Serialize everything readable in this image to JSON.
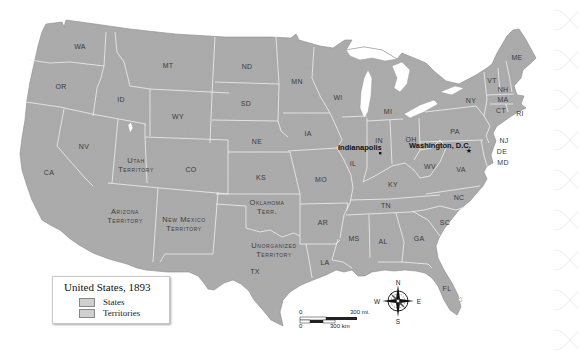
{
  "legend": {
    "title": "United States, 1893",
    "items": [
      {
        "label": "States",
        "color": "#d0d0d0"
      },
      {
        "label": "Territories",
        "color": "#d6d6d6"
      }
    ]
  },
  "colors": {
    "land": "#a9a9a9",
    "border": "#f2f2f2",
    "water": "#ffffff",
    "label": "#3a3a3a"
  },
  "states": [
    {
      "abbr": "WA",
      "x": 80,
      "y": 46
    },
    {
      "abbr": "OR",
      "x": 61,
      "y": 86
    },
    {
      "abbr": "ID",
      "x": 121,
      "y": 99
    },
    {
      "abbr": "MT",
      "x": 168,
      "y": 65
    },
    {
      "abbr": "WY",
      "x": 178,
      "y": 116
    },
    {
      "abbr": "NV",
      "x": 84,
      "y": 146
    },
    {
      "abbr": "CA",
      "x": 49,
      "y": 172
    },
    {
      "abbr": "CO",
      "x": 191,
      "y": 169
    },
    {
      "abbr": "ND",
      "x": 247,
      "y": 66
    },
    {
      "abbr": "SD",
      "x": 246,
      "y": 103
    },
    {
      "abbr": "NE",
      "x": 257,
      "y": 141
    },
    {
      "abbr": "KS",
      "x": 261,
      "y": 177
    },
    {
      "abbr": "MN",
      "x": 297,
      "y": 81
    },
    {
      "abbr": "IA",
      "x": 308,
      "y": 133
    },
    {
      "abbr": "MO",
      "x": 321,
      "y": 179
    },
    {
      "abbr": "AR",
      "x": 323,
      "y": 222
    },
    {
      "abbr": "LA",
      "x": 325,
      "y": 262
    },
    {
      "abbr": "TX",
      "x": 255,
      "y": 271
    },
    {
      "abbr": "WI",
      "x": 338,
      "y": 97
    },
    {
      "abbr": "MI",
      "x": 388,
      "y": 111
    },
    {
      "abbr": "IL",
      "x": 353,
      "y": 163
    },
    {
      "abbr": "IN",
      "x": 379,
      "y": 140
    },
    {
      "abbr": "OH",
      "x": 411,
      "y": 139
    },
    {
      "abbr": "KY",
      "x": 393,
      "y": 184
    },
    {
      "abbr": "TN",
      "x": 386,
      "y": 205
    },
    {
      "abbr": "MS",
      "x": 354,
      "y": 238
    },
    {
      "abbr": "AL",
      "x": 383,
      "y": 241
    },
    {
      "abbr": "GA",
      "x": 419,
      "y": 238
    },
    {
      "abbr": "FL",
      "x": 447,
      "y": 288
    },
    {
      "abbr": "SC",
      "x": 445,
      "y": 222
    },
    {
      "abbr": "NC",
      "x": 459,
      "y": 197
    },
    {
      "abbr": "VA",
      "x": 461,
      "y": 169
    },
    {
      "abbr": "WV",
      "x": 430,
      "y": 166
    },
    {
      "abbr": "PA",
      "x": 455,
      "y": 131
    },
    {
      "abbr": "NY",
      "x": 471,
      "y": 100
    },
    {
      "abbr": "VT",
      "x": 492,
      "y": 80
    },
    {
      "abbr": "NH",
      "x": 503,
      "y": 89
    },
    {
      "abbr": "ME",
      "x": 517,
      "y": 57
    },
    {
      "abbr": "MA",
      "x": 503,
      "y": 99
    },
    {
      "abbr": "CT",
      "x": 501,
      "y": 110
    },
    {
      "abbr": "RI",
      "x": 520,
      "y": 113
    },
    {
      "abbr": "NJ",
      "x": 504,
      "y": 140
    },
    {
      "abbr": "DE",
      "x": 502,
      "y": 151
    },
    {
      "abbr": "MD",
      "x": 503,
      "y": 162
    }
  ],
  "territories": [
    {
      "name_line1": "Utah",
      "name_line2": "Territory",
      "x": 136,
      "y": 165
    },
    {
      "name_line1": "Arizona",
      "name_line2": "Territory",
      "x": 125,
      "y": 216
    },
    {
      "name_line1": "New Mexico",
      "name_line2": "Territory",
      "x": 184,
      "y": 224
    },
    {
      "name_line1": "Oklahoma",
      "name_line2": "Terr.",
      "x": 267,
      "y": 207
    },
    {
      "name_line1": "Unorganized",
      "name_line2": "Territory",
      "x": 274,
      "y": 250
    }
  ],
  "cities": [
    {
      "name": "Indianapolis",
      "x": 338,
      "y": 147,
      "dot_x": 380,
      "dot_y": 153,
      "marker": "dot"
    },
    {
      "name": "Washington, D.C.",
      "x": 409,
      "y": 145,
      "dot_x": 469,
      "dot_y": 150,
      "marker": "star"
    }
  ],
  "scale": {
    "miles_zero": "0",
    "miles_label": "300 mi.",
    "km_zero": "0",
    "km_label": "300 km"
  },
  "compass": {
    "n": "N",
    "s": "S",
    "e": "E",
    "w": "W"
  }
}
